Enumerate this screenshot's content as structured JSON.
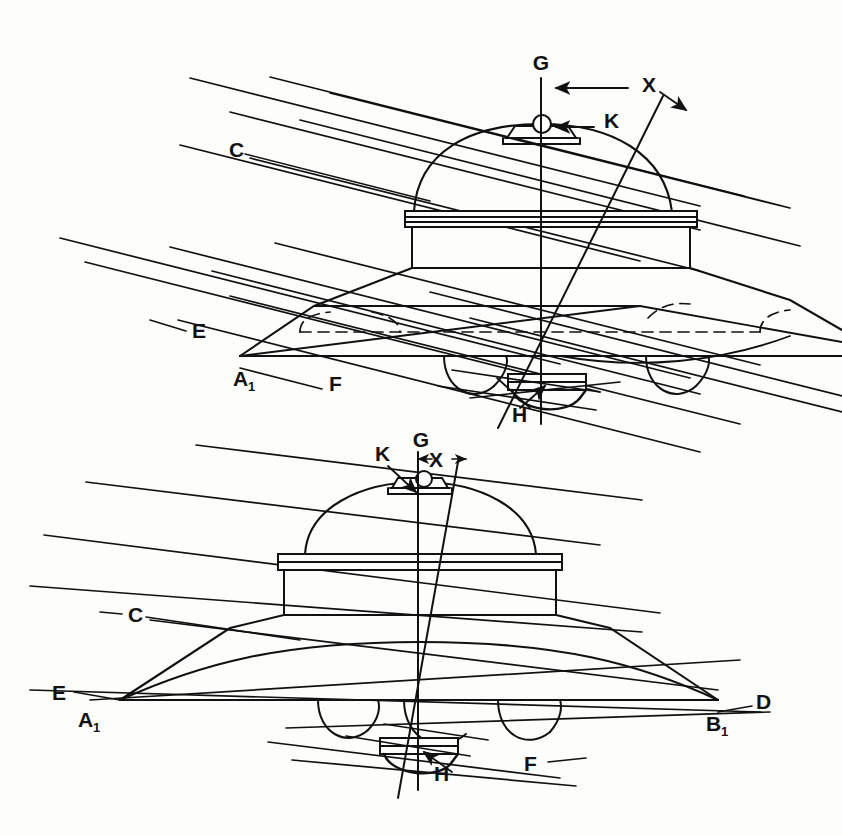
{
  "document": {
    "type": "patent-figure",
    "background_color": "#fdfdfb",
    "ink_color": "#111111",
    "width": 842,
    "height": 836,
    "description": "Two perspective views of a disc-shaped craft with reference axes and parallel ray lines"
  },
  "figures": [
    {
      "id": "upper-figure",
      "name": "oblique-view",
      "labels": [
        {
          "key": "G",
          "text": "G",
          "x": 541,
          "y": 70,
          "role": "vertical-axis-label"
        },
        {
          "key": "X",
          "text": "X",
          "x": 642,
          "y": 92,
          "role": "offset-dimension-label"
        },
        {
          "key": "K",
          "text": "K",
          "x": 604,
          "y": 128,
          "role": "apex-sphere-label"
        },
        {
          "key": "C",
          "text": "C",
          "x": 229,
          "y": 157,
          "role": "ray-line-label"
        },
        {
          "key": "E",
          "text": "E",
          "x": 192,
          "y": 338,
          "role": "ray-line-label"
        },
        {
          "key": "A1",
          "text": "A",
          "sub": "1",
          "x": 233,
          "y": 386,
          "role": "rim-point-label"
        },
        {
          "key": "F",
          "text": "F",
          "x": 329,
          "y": 391,
          "role": "ray-line-label"
        },
        {
          "key": "H",
          "text": "H",
          "x": 521,
          "y": 414,
          "role": "bottom-hub-label"
        }
      ]
    },
    {
      "id": "lower-figure",
      "name": "front-elevation-view",
      "labels": [
        {
          "key": "K",
          "text": "K",
          "x": 381,
          "y": 456,
          "role": "apex-sphere-label"
        },
        {
          "key": "G",
          "text": "G",
          "x": 421,
          "y": 441,
          "role": "vertical-axis-label"
        },
        {
          "key": "X",
          "text": "X",
          "x": 437,
          "y": 460,
          "role": "offset-dimension-label"
        },
        {
          "key": "C",
          "text": "C",
          "x": 131,
          "y": 620,
          "role": "ray-line-label"
        },
        {
          "key": "E",
          "text": "E",
          "x": 57,
          "y": 697,
          "role": "ray-line-label"
        },
        {
          "key": "A1",
          "text": "A",
          "sub": "1",
          "x": 84,
          "y": 723,
          "role": "rim-point-label"
        },
        {
          "key": "B1",
          "text": "B",
          "sub": "1",
          "x": 714,
          "y": 727,
          "role": "rim-point-label"
        },
        {
          "key": "D",
          "text": "D",
          "x": 762,
          "y": 705,
          "role": "ray-line-label"
        },
        {
          "key": "H",
          "text": "H",
          "x": 441,
          "y": 774,
          "role": "bottom-hub-label"
        },
        {
          "key": "F",
          "text": "F",
          "x": 530,
          "y": 765,
          "role": "ray-line-label"
        }
      ]
    }
  ],
  "legend_keys": {
    "C": "upper ray line",
    "D": "right ray line terminus",
    "E": "lower-left ray line",
    "F": "lower ray line",
    "G": "vertical centre axis",
    "H": "bottom hub / pole",
    "K": "apex sphere / top pole",
    "X": "lateral offset dimension",
    "A1": "left rim point",
    "B1": "right rim point"
  }
}
